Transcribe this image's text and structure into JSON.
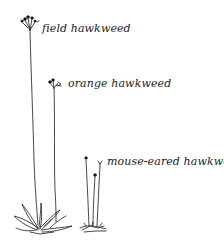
{
  "illustration": {
    "subject": "hawkweed species comparison",
    "labels": {
      "field": "field hawkweed",
      "orange": "orange hawkweed",
      "mouse": "mouse-eared hawkweed"
    },
    "ink_color": "#1a1a1a",
    "background": "#ffffff"
  }
}
